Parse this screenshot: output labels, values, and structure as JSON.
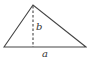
{
  "diagram": {
    "type": "triangle",
    "labels": {
      "base": "a",
      "height": "b"
    },
    "vertices": {
      "left": [
        4,
        47
      ],
      "apex": [
        33,
        5
      ],
      "right": [
        86,
        47
      ]
    },
    "colors": {
      "stroke": "#444444",
      "background": "#ffffff"
    }
  }
}
